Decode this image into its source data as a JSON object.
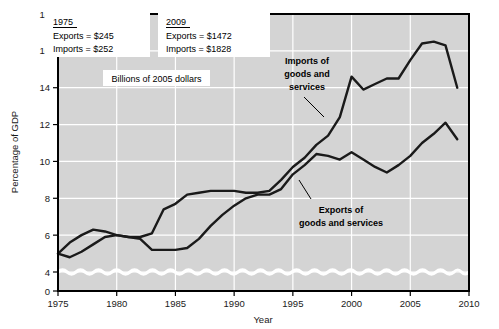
{
  "chart_data": {
    "type": "line",
    "title": "",
    "xlabel": "Year",
    "ylabel": "Percentage of GDP",
    "xlim": [
      1975,
      2010
    ],
    "ylim": [
      0,
      18
    ],
    "ytick_step": 2,
    "xtick_step": 5,
    "grid": true,
    "axis_break": true,
    "axis_break_note": "wavy break between 0 and 4",
    "xticks": [
      "1975",
      "1980",
      "1985",
      "1990",
      "1995",
      "2000",
      "2005",
      "2010"
    ],
    "yticks": [
      "0",
      "4",
      "6",
      "8",
      "10",
      "12",
      "14",
      "16",
      "18"
    ],
    "x": [
      1975,
      1976,
      1977,
      1978,
      1979,
      1980,
      1981,
      1982,
      1983,
      1984,
      1985,
      1986,
      1987,
      1988,
      1989,
      1990,
      1991,
      1992,
      1993,
      1994,
      1995,
      1996,
      1997,
      1998,
      1999,
      2000,
      2001,
      2002,
      2003,
      2004,
      2005,
      2006,
      2007,
      2008,
      2009
    ],
    "series": [
      {
        "name": "Imports of goods and services",
        "color": "#1a1a1a",
        "values": [
          5.0,
          5.6,
          6.0,
          6.3,
          6.2,
          6.0,
          5.9,
          5.9,
          6.1,
          7.4,
          7.7,
          8.2,
          8.3,
          8.4,
          8.4,
          8.4,
          8.3,
          8.3,
          8.4,
          9.0,
          9.7,
          10.2,
          10.9,
          11.4,
          12.4,
          14.6,
          13.9,
          14.2,
          14.5,
          14.5,
          15.5,
          16.4,
          16.5,
          16.3,
          14.0
        ],
        "annotation": "Imports of goods and services"
      },
      {
        "name": "Exports of goods and services",
        "color": "#1a1a1a",
        "values": [
          5.0,
          4.8,
          5.1,
          5.5,
          5.9,
          6.0,
          5.9,
          5.8,
          5.2,
          5.2,
          5.2,
          5.3,
          5.8,
          6.5,
          7.1,
          7.6,
          8.0,
          8.2,
          8.2,
          8.5,
          9.3,
          9.8,
          10.4,
          10.3,
          10.1,
          10.5,
          10.1,
          9.7,
          9.4,
          9.8,
          10.3,
          11.0,
          11.5,
          12.1,
          11.2
        ],
        "annotation": "Exports of goods and services"
      }
    ],
    "annotations": [
      {
        "id": "imports-label",
        "line1": "Imports of",
        "line2": "goods and",
        "line3": "services"
      },
      {
        "id": "exports-label",
        "line1": "Exports of",
        "line2": "goods and services"
      }
    ],
    "callout_boxes": [
      {
        "id": "box-1975",
        "heading": "1975",
        "rows": [
          "Exports  =  $245",
          "Imports  =  $252"
        ]
      },
      {
        "id": "box-2009",
        "heading": "2009",
        "rows": [
          "Exports  =  $1472",
          "Imports  =  $1828"
        ]
      }
    ],
    "units_note": "Billions of 2005 dollars",
    "colors": {
      "plot_background": "#d4d4d4",
      "gridline": "#ffffff",
      "line": "#1a1a1a",
      "axis": "#000000",
      "page_background": "#ffffff"
    }
  }
}
